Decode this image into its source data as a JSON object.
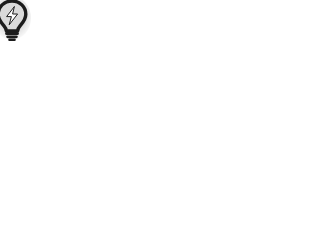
{
  "canvas": {
    "width": 325,
    "height": 233,
    "background_color": "#ffffff",
    "title": "Grid Canvas"
  },
  "badge": {
    "icon_name": "lightbulb-lightning-icon",
    "label": "",
    "outline_color": "#1c1c1c",
    "glyph_color": "#ffffff",
    "halo_color": "#e2e2e2",
    "x": -6,
    "y": -3,
    "width": 40,
    "height": 46
  },
  "grid": {
    "line_color": "#8a8a8a",
    "line_width": 1.5,
    "vertical_line_count": 9,
    "horizontal_line_count": 7,
    "column_spacing": 32,
    "row_spacing": 30,
    "origin_x": 38,
    "origin_y": 30,
    "vertical_lines_x": [
      38,
      70,
      102,
      134,
      166,
      198,
      230,
      262,
      294
    ],
    "horizontal_lines_y": [
      30,
      60,
      90,
      120,
      150,
      180,
      210
    ],
    "vertical_top": 14,
    "vertical_bottom": 228,
    "horizontal_left": 24,
    "horizontal_right": 311,
    "fade_bottom_start": 210,
    "fade_bottom_end": 228
  }
}
